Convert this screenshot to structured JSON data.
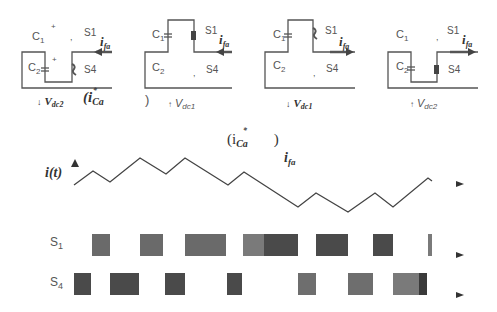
{
  "circuits": [
    {
      "id": "panel-1",
      "labels": {
        "c1": "C",
        "c1_sub": "1",
        "c2": "C",
        "c2_sub": "2",
        "s1": "S1",
        "s4": "S4",
        "current": "i",
        "current_sub": "fa",
        "plus1": "+",
        "plus2": "+"
      },
      "voltage": {
        "text": "V",
        "sub": "dc2",
        "arrow": "↓"
      },
      "current_direction": "in",
      "extra": {
        "text": "(i",
        "sub": "Ca",
        "sup": "*"
      }
    },
    {
      "id": "panel-2",
      "labels": {
        "c1": "C",
        "c1_sub": "1",
        "c2": "C",
        "c2_sub": "2",
        "s1": "S1",
        "s4": "S4",
        "current": "i",
        "current_sub": "fa"
      },
      "voltage": {
        "text": "V",
        "sub": "dc1",
        "arrow": "↑"
      },
      "current_direction": "in",
      "extra": {
        "text": ")"
      }
    },
    {
      "id": "panel-3",
      "labels": {
        "c1": "C",
        "c1_sub": "1",
        "c2": "C",
        "c2_sub": "2",
        "s1": "S1",
        "s4": "S4",
        "current": "i",
        "current_sub": "fa"
      },
      "voltage": {
        "text": "V",
        "sub": "dc1",
        "arrow": "↓"
      },
      "current_direction": "out"
    },
    {
      "id": "panel-4",
      "labels": {
        "c1": "C",
        "c1_sub": "1",
        "c2": "C",
        "c2_sub": "2",
        "s1": "S1",
        "s4": "S4",
        "current": "i",
        "current_sub": "fa"
      },
      "voltage": {
        "text": "V",
        "sub": "dc2",
        "arrow": "↑"
      },
      "current_direction": "out"
    }
  ],
  "waveform": {
    "y_label": "i(t)",
    "ref_label": {
      "open": "(i",
      "sub": "Ca",
      "sup": "*",
      "close": ")"
    },
    "trace_label": {
      "text": "i",
      "sub": "fa"
    },
    "points": [
      [
        74,
        185
      ],
      [
        93,
        171
      ],
      [
        110,
        182
      ],
      [
        140,
        158
      ],
      [
        166,
        174
      ],
      [
        185,
        158
      ],
      [
        228,
        185
      ],
      [
        244,
        172
      ],
      [
        298,
        207
      ],
      [
        316,
        193
      ],
      [
        348,
        212
      ],
      [
        375,
        193
      ],
      [
        393,
        207
      ],
      [
        428,
        178
      ],
      [
        432,
        181
      ]
    ]
  },
  "switching": {
    "s1": {
      "label": "S",
      "sub": "1",
      "blocks": [
        {
          "x0": 92,
          "x1": 110,
          "shade": "#6a6a6a"
        },
        {
          "x0": 140,
          "x1": 163,
          "shade": "#6a6a6a"
        },
        {
          "x0": 185,
          "x1": 226,
          "shade": "#6a6a6a"
        },
        {
          "x0": 243,
          "x1": 264,
          "shade": "#7a7a7a"
        },
        {
          "x0": 264,
          "x1": 298,
          "shade": "#4a4a4a"
        },
        {
          "x0": 316,
          "x1": 348,
          "shade": "#4a4a4a"
        },
        {
          "x0": 373,
          "x1": 393,
          "shade": "#4a4a4a"
        },
        {
          "x0": 428,
          "x1": 432,
          "shade": "#7a7a7a"
        }
      ]
    },
    "s4": {
      "label": "S",
      "sub": "4",
      "blocks": [
        {
          "x0": 74,
          "x1": 91,
          "shade": "#4a4a4a"
        },
        {
          "x0": 110,
          "x1": 139,
          "shade": "#4a4a4a"
        },
        {
          "x0": 165,
          "x1": 185,
          "shade": "#4a4a4a"
        },
        {
          "x0": 227,
          "x1": 242,
          "shade": "#4a4a4a"
        },
        {
          "x0": 298,
          "x1": 316,
          "shade": "#6e6e6e"
        },
        {
          "x0": 348,
          "x1": 373,
          "shade": "#6e6e6e"
        },
        {
          "x0": 393,
          "x1": 419,
          "shade": "#7a7a7a"
        },
        {
          "x0": 419,
          "x1": 427,
          "shade": "#3a3a3a"
        }
      ]
    }
  },
  "colors": {
    "line": "#555555",
    "dark_block": "#4a4a4a",
    "light_block": "#6e6e6e",
    "background": "#ffffff"
  }
}
